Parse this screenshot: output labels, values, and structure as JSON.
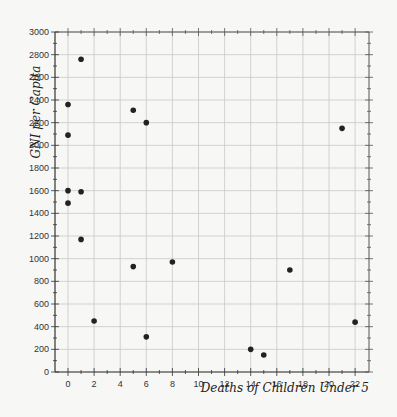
{
  "chart_data": {
    "type": "scatter",
    "title": "",
    "xlabel": "Deaths of Children Under 5",
    "ylabel": "GNI per Capita",
    "xlim": [
      -1,
      23
    ],
    "ylim": [
      0,
      3000
    ],
    "xticks": [
      0,
      2,
      4,
      6,
      8,
      10,
      12,
      14,
      16,
      18,
      20,
      22
    ],
    "yticks": [
      0,
      200,
      400,
      600,
      800,
      1000,
      1200,
      1400,
      1600,
      1800,
      2000,
      2200,
      2400,
      2600,
      2800,
      3000
    ],
    "grid": true,
    "legend": null,
    "marker_color": "#222222",
    "points": [
      {
        "x": 0,
        "y": 2360
      },
      {
        "x": 0,
        "y": 2090
      },
      {
        "x": 0,
        "y": 1600
      },
      {
        "x": 0,
        "y": 1490
      },
      {
        "x": 1,
        "y": 2760
      },
      {
        "x": 1,
        "y": 1590
      },
      {
        "x": 1,
        "y": 1170
      },
      {
        "x": 2,
        "y": 450
      },
      {
        "x": 5,
        "y": 2310
      },
      {
        "x": 5,
        "y": 930
      },
      {
        "x": 6,
        "y": 2200
      },
      {
        "x": 6,
        "y": 310
      },
      {
        "x": 8,
        "y": 970
      },
      {
        "x": 14,
        "y": 200
      },
      {
        "x": 15,
        "y": 150
      },
      {
        "x": 17,
        "y": 900
      },
      {
        "x": 21,
        "y": 2150
      },
      {
        "x": 22,
        "y": 440
      }
    ]
  }
}
